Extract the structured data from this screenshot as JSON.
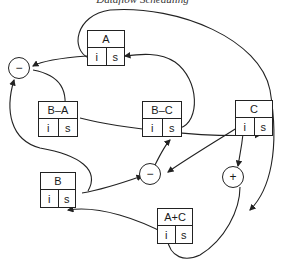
{
  "caption": "Dataflow Scheduling",
  "nodes": {
    "A": {
      "label": "A",
      "i": "i",
      "s": "s"
    },
    "BA": {
      "label": "B–A",
      "i": "i",
      "s": "s"
    },
    "BC": {
      "label": "B–C",
      "i": "i",
      "s": "s"
    },
    "C": {
      "label": "C",
      "i": "i",
      "s": "s"
    },
    "B": {
      "label": "B",
      "i": "i",
      "s": "s"
    },
    "AC": {
      "label": "A+C",
      "i": "i",
      "s": "s"
    }
  },
  "operators": {
    "minus_top": {
      "symbol": "−"
    },
    "minus_mid": {
      "symbol": "−"
    },
    "plus": {
      "symbol": "+"
    }
  },
  "colors": {
    "stroke": "#222222",
    "background": "#ffffff"
  }
}
